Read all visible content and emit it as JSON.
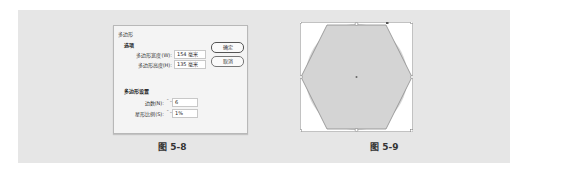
{
  "figure_left": {
    "dialog": {
      "title": "多边形",
      "options_group": {
        "label": "选项",
        "width_label": "多边形宽度(W):",
        "width_value": "154 毫米",
        "height_label": "多边形高度(H):",
        "height_value": "135 毫米"
      },
      "ok_button": "确定",
      "cancel_button": "取消",
      "settings_group": {
        "label": "多边形设置",
        "sides_label": "边数(N):",
        "sides_value": "6",
        "star_ratio_label": "星形比例(S):",
        "star_ratio_value": "1%"
      },
      "spinner_glyph": "⌃⌄"
    },
    "caption": "图 5-8"
  },
  "figure_right": {
    "shape": "hexagon",
    "fill_color": "#d4d4d4",
    "stroke_color": "#888888",
    "caption": "图 5-9"
  }
}
